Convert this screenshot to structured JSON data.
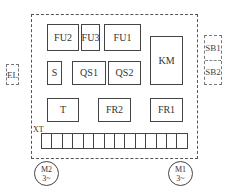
{
  "diagram": {
    "type": "electrical-panel-layout",
    "panel": {
      "components": [
        {
          "id": "fu2",
          "label": "FU2"
        },
        {
          "id": "fu3",
          "label": "FU3"
        },
        {
          "id": "fu1",
          "label": "FU1"
        },
        {
          "id": "km",
          "label": "KM"
        },
        {
          "id": "s",
          "label": "S"
        },
        {
          "id": "qs1",
          "label": "QS1"
        },
        {
          "id": "qs2",
          "label": "QS2"
        },
        {
          "id": "t",
          "label": "T"
        },
        {
          "id": "fr2",
          "label": "FR2"
        },
        {
          "id": "fr1",
          "label": "FR1"
        }
      ],
      "terminal_block": {
        "label": "XT",
        "cell_count": 14
      }
    },
    "external": {
      "lamp": {
        "label": "EL"
      },
      "buttons": [
        {
          "label": "SB1"
        },
        {
          "label": "SB2"
        }
      ],
      "motors": [
        {
          "id": "m2",
          "name": "M2",
          "phase": "3~"
        },
        {
          "id": "m1",
          "name": "M1",
          "phase": "3~"
        }
      ]
    }
  }
}
